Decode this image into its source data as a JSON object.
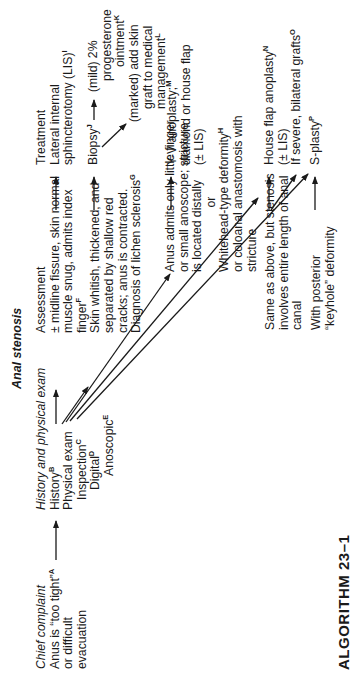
{
  "title": "Anal stenosis",
  "algorithm_label": "ALGORITHM  23–1",
  "columns": {
    "chief_complaint": {
      "header": "Chief complaint",
      "lines": [
        "Anus is “too tight”",
        "or difficult",
        "evacuation"
      ],
      "sup": "A"
    },
    "history_exam": {
      "header": "History and physical exam",
      "history": "History",
      "history_sup": "B",
      "physical": "Physical exam",
      "inspection": "Inspection",
      "inspection_sup": "C",
      "digital": "Digital",
      "digital_sup": "D",
      "anoscopic": "Anoscopic",
      "anoscopic_sup": "E"
    },
    "assessment": {
      "header": "Assessment",
      "items": [
        {
          "lines": [
            "± midline fissure, skin normal",
            "muscle snug, admits index",
            "finger"
          ],
          "sup": "F"
        },
        {
          "lines": [
            "Skin whitish, thickened, and",
            "separated by shallow red",
            "cracks; anus is contracted.",
            "Diagnosis of lichen sclerosis"
          ],
          "sup": "G"
        },
        {
          "lines": [
            "Anus admits only little finger",
            "or small anoscope; stricture",
            "is located distally"
          ],
          "or": "or",
          "lines2": [
            "Whitehead-type deformity",
            "or coloanal anastomosis with",
            "stricture"
          ],
          "sup": "H"
        },
        {
          "lines": [
            "Same as above, but stenosis",
            "involves entire length of anal",
            "canal"
          ]
        },
        {
          "lines": [
            "With posterior",
            "“keyhole” deformity"
          ]
        }
      ]
    },
    "treatment": {
      "header": "Treatment",
      "lis": [
        "Lateral internal",
        "sphincterotomy (LIS)"
      ],
      "lis_sup": "I",
      "biopsy": "Biopsy",
      "biopsy_sup": "J",
      "mild": [
        "(mild)  2%",
        "progesterone",
        "ointment"
      ],
      "mild_sup": "K",
      "marked": [
        "(marked) add skin",
        "graft to medical",
        "management"
      ],
      "marked_sup": "L",
      "yv": [
        "Y-V anoplasty;",
        "diamond or house flap",
        "(± LIS)"
      ],
      "yv_sup": "M",
      "house": [
        "House flap anoplasty",
        "(± LIS)"
      ],
      "house_sup": "N",
      "severe": "If severe, bilateral grafts",
      "severe_sup": "O",
      "splasty": "S-plasty",
      "splasty_sup": "P"
    }
  },
  "colors": {
    "text": "#1a1a1a",
    "line": "#1a1a1a",
    "background": "#ffffff"
  }
}
